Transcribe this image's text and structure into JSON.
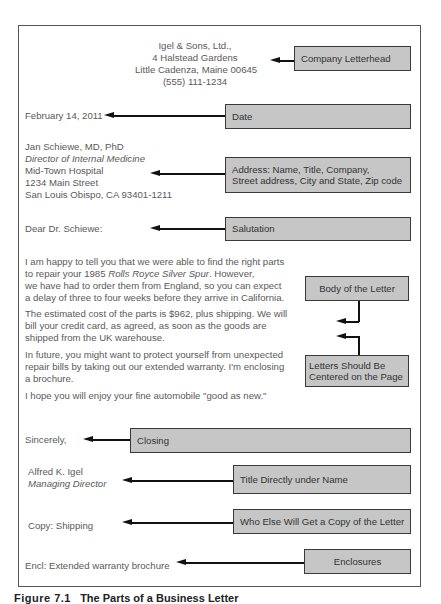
{
  "letter": {
    "letterhead": [
      "Igel & Sons, Ltd.,",
      "4 Halstead Gardens",
      "Little Cadenza, Maine 00645",
      "(555) 111-1234"
    ],
    "date": "February 14, 2011",
    "address": {
      "name": "Jan Schiewe, MD, PhD",
      "title": "Director of Internal Medicine",
      "company": "Mid-Town Hospital",
      "street": "1234 Main Street",
      "city_state_zip": "San Louis Obispo, CA  93401-1211"
    },
    "salutation": "Dear Dr. Schiewe:",
    "body": {
      "p1": {
        "l1": "I am happy to tell you that we were able to find the right parts",
        "l2a": "to repair your 1985 ",
        "l2b": "Rolls Royce Silver Spur",
        "l2c": ". However,",
        "l3": "we have had to order them from England, so you can expect",
        "l4": "a delay of three to four weeks before they arrive in California."
      },
      "p2": [
        "The estimated cost of the parts is $962, plus shipping. We will",
        "bill your credit card, as agreed, as soon as the goods are",
        "shipped from the UK warehouse."
      ],
      "p3": [
        "In future, you might want to protect yourself from unexpected",
        "repair bills by taking out our extended warranty. I'm enclosing",
        "a brochure."
      ],
      "p4": "I hope you will enjoy your fine automobile \"good as new.\""
    },
    "closing": "Sincerely,",
    "signer": {
      "name": "Alfred K. Igel",
      "title": "Managing Director"
    },
    "copy": "Copy: Shipping",
    "enclosure": "Encl: Extended warranty brochure"
  },
  "labels": {
    "letterhead": "Company Letterhead",
    "date": "Date",
    "address_l1": "Address: Name, Title, Company,",
    "address_l2": "Street address, City and State, Zip code",
    "salutation": "Salutation",
    "body": "Body of the Letter",
    "centered_l1": "Letters Should Be",
    "centered_l2": "Centered on the Page",
    "closing": "Closing",
    "title_under_name": "Title Directly under Name",
    "copy": "Who Else Will Get a Copy of the Letter",
    "enclosures": "Enclosures"
  },
  "caption": {
    "figure": "Figure 7.1",
    "title": "The Parts of a Business Letter"
  },
  "colors": {
    "label_fill": "#c6c6c6",
    "label_border": "#3a3a3a",
    "text": "#5a5a5a",
    "arrow": "#111111"
  }
}
